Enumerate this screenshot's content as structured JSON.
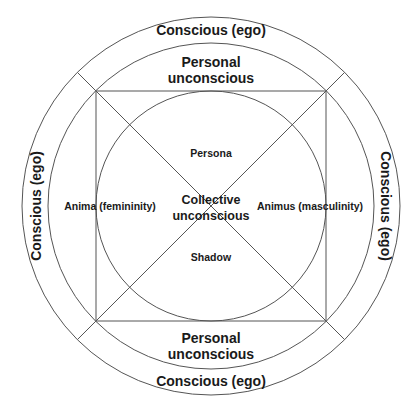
{
  "diagram": {
    "type": "jung-psyche-model",
    "colors": {
      "stroke": "#555555",
      "text": "#1a1a1a",
      "background": "#ffffff"
    },
    "rings": {
      "outer": {
        "label_top": "Conscious (ego)",
        "label_bottom": "Conscious (ego)",
        "label_left": "Conscious (ego)",
        "label_right": "Conscious (ego)"
      },
      "middle": {
        "label_top_line1": "Personal",
        "label_top_line2": "unconscious",
        "label_bottom_line1": "Personal",
        "label_bottom_line2": "unconscious"
      }
    },
    "center": {
      "line1": "Collective",
      "line2": "unconscious"
    },
    "archetypes": {
      "top": "Persona",
      "bottom": "Shadow",
      "left": "Anima (femininity)",
      "right": "Animus (masculinity)"
    }
  }
}
